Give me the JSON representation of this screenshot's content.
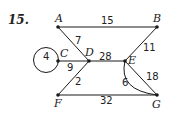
{
  "problem_number": "15.",
  "graph": {
    "nodes": [
      {
        "id": "A",
        "label": "A",
        "x": 58,
        "y": 27,
        "lx": 55,
        "ly": 22
      },
      {
        "id": "B",
        "label": "B",
        "x": 157,
        "y": 27,
        "lx": 153,
        "ly": 22
      },
      {
        "id": "C",
        "label": "C",
        "x": 58,
        "y": 61,
        "lx": 60,
        "ly": 57
      },
      {
        "id": "D",
        "label": "D",
        "x": 89,
        "y": 61,
        "lx": 85,
        "ly": 56
      },
      {
        "id": "E",
        "label": "E",
        "x": 125,
        "y": 61,
        "lx": 128,
        "ly": 64
      },
      {
        "id": "F",
        "label": "F",
        "x": 58,
        "y": 95,
        "lx": 54,
        "ly": 107
      },
      {
        "id": "G",
        "label": "G",
        "x": 157,
        "y": 95,
        "lx": 152,
        "ly": 108
      }
    ],
    "edges": [
      {
        "from": "A",
        "to": "B",
        "weight": "15",
        "wx": 103,
        "wy": 24
      },
      {
        "from": "A",
        "to": "D",
        "weight": "7",
        "wx": 75,
        "wy": 44
      },
      {
        "from": "C",
        "to": "C",
        "weight": "4",
        "wx": 43,
        "wy": 60,
        "type": "loop"
      },
      {
        "from": "C",
        "to": "D",
        "weight": "9",
        "wx": 66,
        "wy": 71
      },
      {
        "from": "D",
        "to": "E",
        "weight": "28",
        "wx": 100,
        "wy": 59
      },
      {
        "from": "B",
        "to": "E",
        "weight": "11",
        "wx": 144,
        "wy": 51
      },
      {
        "from": "D",
        "to": "F",
        "weight": "2",
        "wx": 74,
        "wy": 85
      },
      {
        "from": "E",
        "to": "G",
        "weight": "18",
        "wx": 146,
        "wy": 80,
        "type": "straight"
      },
      {
        "from": "E",
        "to": "G",
        "weight": "6",
        "wx": 121,
        "wy": 86,
        "type": "curved"
      },
      {
        "from": "F",
        "to": "G",
        "weight": "32",
        "wx": 101,
        "wy": 103
      }
    ]
  },
  "colors": {
    "line": "#1a1a1a",
    "text": "#222222",
    "background": "#ffffff"
  }
}
